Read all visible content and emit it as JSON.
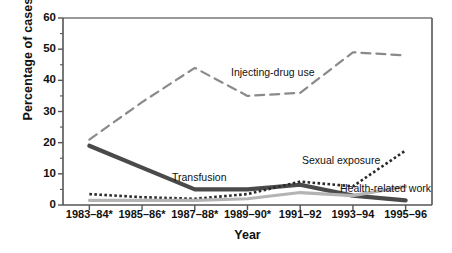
{
  "chart_data": {
    "type": "line",
    "title": "",
    "xlabel": "Year",
    "ylabel": "Percentage of cases",
    "categories": [
      "1983–84*",
      "1985–86*",
      "1987–88*",
      "1989–90*",
      "1991–92",
      "1993–94",
      "1995–96"
    ],
    "yticks": [
      "0",
      "10",
      "20",
      "30",
      "40",
      "50",
      "60"
    ],
    "ylim": [
      0,
      60
    ],
    "ytick_step": 10,
    "minor_tick_step": 5,
    "grid": false,
    "legend_position": "inline-annotations",
    "series": [
      {
        "name": "Injecting-drug use",
        "style": "dashed",
        "color": "#8a8a8a",
        "width": 2.2,
        "values": [
          21,
          33,
          44,
          35,
          36,
          49,
          48
        ],
        "annotation": {
          "text": "Injecting-drug use",
          "x": 231,
          "y": 67
        }
      },
      {
        "name": "Transfusion",
        "style": "solid",
        "color": "#4a4a4a",
        "width": 4.2,
        "values": [
          19,
          12,
          5,
          5,
          6.5,
          3,
          1.5
        ],
        "annotation": {
          "text": "Transfusion",
          "x": 172,
          "y": 172
        }
      },
      {
        "name": "Sexual exposure",
        "style": "dotted",
        "color": "#2b2b2b",
        "width": 2.6,
        "values": [
          3.5,
          2.5,
          2,
          3.5,
          7.5,
          6,
          17.5
        ],
        "annotation": {
          "text": "Sexual exposure",
          "x": 302,
          "y": 155
        }
      },
      {
        "name": "Health-related work",
        "style": "solid",
        "color": "#b4b4b4",
        "width": 3.2,
        "values": [
          1.5,
          1.5,
          1.5,
          2,
          4,
          3,
          6
        ],
        "annotation": {
          "text": "Health-related work",
          "x": 340,
          "y": 183
        }
      }
    ]
  },
  "axes": {
    "plot": {
      "left": 63,
      "right": 432,
      "top": 18,
      "bottom": 205
    }
  }
}
